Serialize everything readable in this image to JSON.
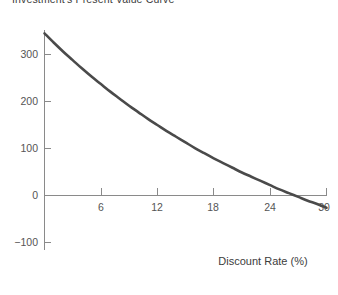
{
  "chart_data": {
    "type": "line",
    "title": "Investment's Present Value Curve",
    "xlabel": "Discount Rate (%)",
    "ylabel": "",
    "xlim": [
      0,
      30
    ],
    "ylim": [
      -100,
      345
    ],
    "xticks": [
      6,
      12,
      18,
      24,
      30
    ],
    "xtick_labels": [
      "6",
      "12",
      "18",
      "24",
      "30"
    ],
    "yticks": [
      300,
      200,
      100,
      0,
      -100
    ],
    "ytick_labels": [
      "300",
      "200",
      "100",
      "0",
      "−100"
    ],
    "grid": false,
    "legend": "none",
    "series": [
      {
        "name": "Present Value",
        "color": "#4a4a4a",
        "line_width": 2.6,
        "x": [
          0,
          1,
          2,
          3,
          4,
          5,
          6,
          7,
          8,
          9,
          10,
          11,
          12,
          13,
          14,
          15,
          16,
          17,
          18,
          19,
          20,
          21,
          22,
          23,
          24,
          25,
          26,
          27,
          28,
          29,
          30
        ],
        "values": [
          345,
          325,
          306,
          288,
          270,
          253,
          237,
          221,
          206,
          191,
          177,
          163,
          150,
          137,
          125,
          113,
          101,
          90,
          79,
          69,
          59,
          49,
          40,
          31,
          22,
          13,
          5,
          -3,
          -11,
          -18,
          -26
        ]
      }
    ],
    "annotations": {
      "zero_crossing_x": 19.2,
      "start_value": 345,
      "end_value": -100
    }
  },
  "axes": {
    "x_axis_title": "Discount Rate (%)",
    "y_axis_title": ""
  }
}
